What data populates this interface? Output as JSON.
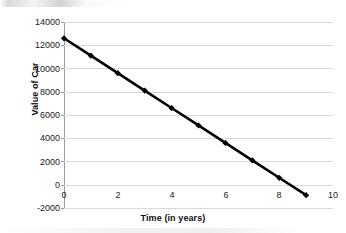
{
  "chart_data": {
    "type": "line",
    "title": "",
    "xlabel": "Time (in years)",
    "ylabel": "Value of Car",
    "x": [
      0,
      1,
      2,
      3,
      4,
      5,
      6,
      7,
      8,
      9
    ],
    "values": [
      12600,
      11100,
      9600,
      8100,
      6600,
      5100,
      3600,
      2100,
      600,
      -900
    ],
    "series": [
      {
        "name": "Value of Car",
        "values": [
          12600,
          11100,
          9600,
          8100,
          6600,
          5100,
          3600,
          2100,
          600,
          -900
        ]
      }
    ],
    "xlim": [
      0,
      10
    ],
    "ylim": [
      -2000,
      14000
    ],
    "xticks": [
      0,
      2,
      4,
      6,
      8,
      10
    ],
    "xtick_labels": [
      "0",
      "2",
      "4",
      "6",
      "8",
      "10"
    ],
    "yticks": [
      -2000,
      0,
      2000,
      4000,
      6000,
      8000,
      10000,
      12000,
      14000
    ],
    "ytick_labels": [
      "-2000",
      "0",
      "2000",
      "4000",
      "6000",
      "8000",
      "10000",
      "12000",
      "14000"
    ],
    "grid": "horizontal",
    "legend": "none",
    "line_color": "#000000",
    "grid_color": "#d9d9d9",
    "marker": "diamond"
  }
}
